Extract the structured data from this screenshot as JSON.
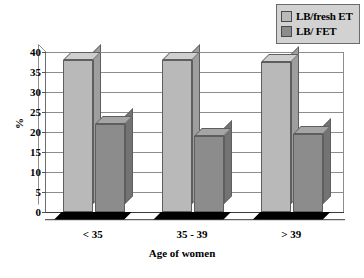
{
  "chart_data": {
    "type": "bar",
    "title": "",
    "subtitle": "",
    "xlabel": "Age of women",
    "ylabel": "%",
    "ylim": [
      0,
      40
    ],
    "ytick_step": 5,
    "yticks": [
      "40",
      "35",
      "30",
      "25",
      "20",
      "15",
      "10",
      "5",
      "0"
    ],
    "grid": "horizontal",
    "legend_position": "top-right",
    "style": "3d-clustered-column",
    "categories": [
      "< 35",
      "35 - 39",
      "> 39"
    ],
    "series": [
      {
        "name": "LB/fresh ET",
        "color": "#b9b9b9",
        "values": [
          38,
          38,
          37.5
        ]
      },
      {
        "name": "LB/ FET",
        "color": "#8c8c8c",
        "values": [
          22,
          19,
          19.5
        ]
      }
    ]
  },
  "legend": {
    "items": [
      {
        "label": "LB/fresh ET",
        "swatch": "#b9b9b9"
      },
      {
        "label": "LB/ FET",
        "swatch": "#8c8c8c"
      }
    ]
  },
  "colors": {
    "series_light": "#b9b9b9",
    "series_light_top": "#cfcfcf",
    "series_light_side": "#9e9e9e",
    "series_dark": "#8c8c8c",
    "series_dark_top": "#a5a5a5",
    "series_dark_side": "#737373",
    "gridline": "#8d8d8d",
    "axis": "#3a3a3a",
    "floor": "#000000",
    "legend_bg": "#d2d2d2",
    "legend_border": "#6b6b6b",
    "text": "#000000",
    "background": "#ffffff"
  }
}
